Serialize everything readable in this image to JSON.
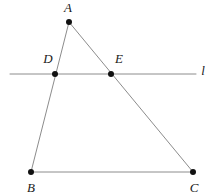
{
  "figure": {
    "background_color": "#ffffff",
    "line_color": "#8c8c8c",
    "point_color": "#111111",
    "label_color": "#1a1a1a",
    "width": 214,
    "height": 196
  },
  "points": {
    "A": {
      "label": "A",
      "x": 69,
      "y": 22,
      "label_x": 68,
      "label_y": 9
    },
    "B": {
      "label": "B",
      "x": 31,
      "y": 172,
      "label_x": 31,
      "label_y": 189
    },
    "C": {
      "label": "C",
      "x": 193,
      "y": 172,
      "label_x": 194,
      "label_y": 189
    },
    "D": {
      "label": "D",
      "x": 55,
      "y": 74,
      "label_x": 48,
      "label_y": 60
    },
    "E": {
      "label": "E",
      "x": 111,
      "y": 74,
      "label_x": 119,
      "label_y": 60
    }
  },
  "segments": [
    {
      "name": "side-AB",
      "from": "A",
      "to": "B",
      "x1": 69,
      "y1": 22,
      "x2": 31,
      "y2": 172
    },
    {
      "name": "side-AC",
      "from": "A",
      "to": "C",
      "x1": 69,
      "y1": 22,
      "x2": 193,
      "y2": 172
    },
    {
      "name": "side-BC",
      "from": "B",
      "to": "C",
      "x1": 31,
      "y1": 172,
      "x2": 193,
      "y2": 172
    }
  ],
  "lines": [
    {
      "name": "transversal-line-l",
      "label": "l",
      "x1": 10,
      "y1": 74,
      "x2": 196,
      "y2": 74,
      "label_x": 203,
      "label_y": 72
    }
  ]
}
